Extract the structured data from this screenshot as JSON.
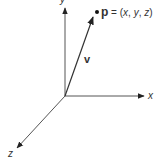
{
  "diagram": {
    "type": "3d-coordinate-axes",
    "axes": {
      "x": {
        "label": "x"
      },
      "y": {
        "label": "y"
      },
      "z": {
        "label": "z"
      }
    },
    "vector": {
      "label": "v"
    },
    "point": {
      "name": "p",
      "equals": " = (",
      "coords": [
        "x",
        "y",
        "z"
      ],
      "sep": ", ",
      "close": ")"
    },
    "colors": {
      "line": "#333333",
      "background": "#ffffff"
    }
  }
}
